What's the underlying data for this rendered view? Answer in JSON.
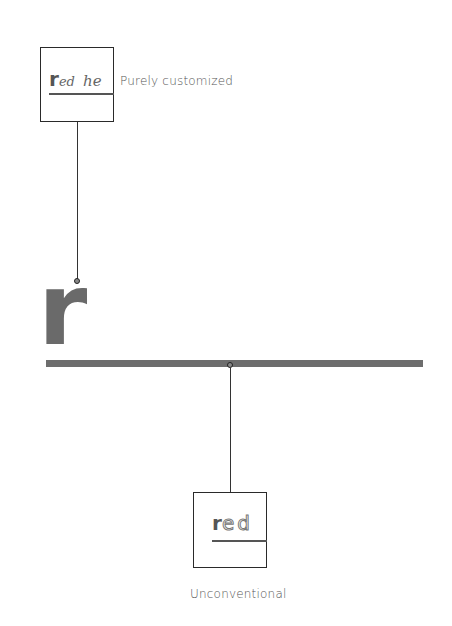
{
  "diagram": {
    "top_node": {
      "sample_text_bold": "r",
      "sample_text_script": "ed",
      "sample_text_script2": "he",
      "label": "Purely customized"
    },
    "center_glyph": "r",
    "bottom_node": {
      "sample_text_bold": "r",
      "sample_text_dotted": "ed",
      "label": "Unconventional"
    },
    "colors": {
      "bar": "#6d6d6d",
      "glyph": "#6a6a6a",
      "line": "#333333",
      "label": "#555555"
    }
  }
}
